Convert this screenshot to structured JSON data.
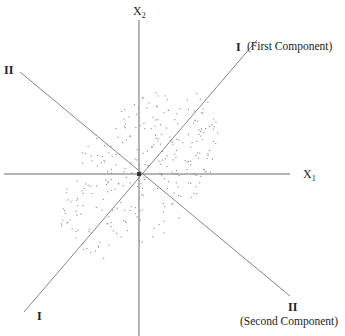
{
  "diagram": {
    "type": "principal-component-axes",
    "axes": {
      "x1": {
        "label": "X",
        "sub": "1"
      },
      "x2": {
        "label": "X",
        "sub": "2"
      }
    },
    "components": {
      "first": {
        "numeral": "I",
        "name": "(First Component)"
      },
      "second": {
        "numeral": "II",
        "name": "(Second Component)"
      }
    },
    "lower_left_numeral": "I",
    "upper_left_numeral": "II",
    "colors": {
      "axis_line": "#666666",
      "component_line": "#777777",
      "points": "#8a8a8a",
      "text": "#222222"
    }
  }
}
